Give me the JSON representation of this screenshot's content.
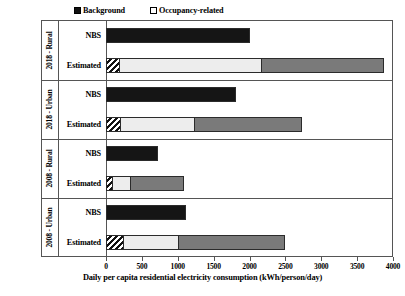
{
  "chart_data": {
    "type": "bar",
    "orientation": "horizontal",
    "stacked": true,
    "title": "",
    "xlabel": "Daily per capita residential electricity consumption (kWh/person/day)",
    "ylabel": "",
    "xlim": [
      0,
      4000
    ],
    "xticks": [
      0,
      500,
      1000,
      1500,
      2000,
      2500,
      3000,
      3500,
      4000
    ],
    "xtick_labels": [
      "0",
      "500",
      "1000",
      "1500",
      "2000",
      "2500",
      "3000",
      "3500",
      "4000"
    ],
    "grid": false,
    "legend_position": "top-left",
    "legend": [
      {
        "label": "Background",
        "pattern": "solid-black",
        "color": "#151515"
      },
      {
        "label": "Occupancy-related",
        "pattern": "solid-white",
        "color": "#ffffff"
      }
    ],
    "segment_styles": [
      {
        "name": "hatch",
        "pattern": "diagonal-hatch",
        "color": "#111111"
      },
      {
        "name": "light",
        "pattern": "solid-light-gray",
        "color": "#ededed"
      },
      {
        "name": "dark",
        "pattern": "solid-dark-gray",
        "color": "#7a7a7a"
      },
      {
        "name": "black",
        "pattern": "solid-black",
        "color": "#151515"
      }
    ],
    "groups": [
      {
        "label": "2018 - Rural",
        "series": [
          {
            "name": "NBS",
            "total": 2010,
            "segments": [
              {
                "style": "black",
                "value": 2010
              }
            ]
          },
          {
            "name": "Estimated",
            "total": 3880,
            "segments": [
              {
                "style": "hatch",
                "value": 195
              },
              {
                "style": "light",
                "value": 1985
              },
              {
                "style": "dark",
                "value": 1700
              }
            ]
          }
        ]
      },
      {
        "label": "2018 - Urban",
        "series": [
          {
            "name": "NBS",
            "total": 1805,
            "segments": [
              {
                "style": "black",
                "value": 1805
              }
            ]
          },
          {
            "name": "Estimated",
            "total": 2730,
            "segments": [
              {
                "style": "hatch",
                "value": 215
              },
              {
                "style": "light",
                "value": 1030
              },
              {
                "style": "dark",
                "value": 1485
              }
            ]
          }
        ]
      },
      {
        "label": "2008 - Rural",
        "series": [
          {
            "name": "NBS",
            "total": 720,
            "segments": [
              {
                "style": "black",
                "value": 720
              }
            ]
          },
          {
            "name": "Estimated",
            "total": 1085,
            "segments": [
              {
                "style": "hatch",
                "value": 100
              },
              {
                "style": "light",
                "value": 245
              },
              {
                "style": "dark",
                "value": 740
              }
            ]
          }
        ]
      },
      {
        "label": "2008 - Urban",
        "series": [
          {
            "name": "NBS",
            "total": 1120,
            "segments": [
              {
                "style": "black",
                "value": 1120
              }
            ]
          },
          {
            "name": "Estimated",
            "total": 2500,
            "segments": [
              {
                "style": "hatch",
                "value": 250
              },
              {
                "style": "light",
                "value": 770
              },
              {
                "style": "dark",
                "value": 1480
              }
            ]
          }
        ]
      }
    ]
  }
}
